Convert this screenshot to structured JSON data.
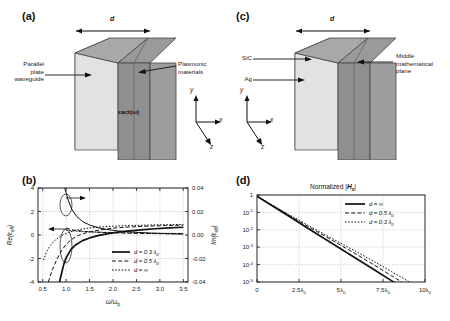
{
  "figure": {
    "panels": [
      "a",
      "b",
      "c",
      "d"
    ]
  },
  "panel_a": {
    "label": "(a)",
    "dim_label": "d",
    "left_annotation": "Parallel\nplate\nwaveguide",
    "right_annotation": "Plasmonic\nmaterials",
    "face_label": "εact(ω)",
    "axes": {
      "x": "x",
      "y": "y",
      "z": "z"
    }
  },
  "panel_c": {
    "label": "(c)",
    "dim_label": "d",
    "annotation_sic": "SiC",
    "annotation_ag": "Ag",
    "right_annotation": "Middle\nmathematical\nplane",
    "axes": {
      "x": "x",
      "y": "y",
      "z": "z"
    }
  },
  "panel_b": {
    "label": "(b)",
    "arrow_left_note": "Re(εeff) points to left axis",
    "arrow_right_note": "Im(εeff) points to right axis"
  },
  "panel_d": {
    "label": "(d)"
  },
  "chart_data": [
    {
      "id": "panel-b",
      "type": "line",
      "title": "",
      "xlabel": "ω/ωp",
      "ylabel": "Re(εeff)",
      "y2label": "Im(εeff)",
      "xlim": [
        0.4,
        3.6
      ],
      "ylim": [
        -4,
        4
      ],
      "y2lim": [
        -0.04,
        0.04
      ],
      "xticks": [
        0.5,
        1.0,
        1.5,
        2.0,
        2.5,
        3.0,
        3.5
      ],
      "xticklabels": [
        "0.5",
        "1.0",
        "1.5",
        "2.0",
        "2.5",
        "3.0",
        "3.5"
      ],
      "yticks": [
        -4,
        -2,
        0,
        2,
        4
      ],
      "yticklabels": [
        "-4",
        "-2",
        "0",
        "2",
        "4"
      ],
      "y2ticks": [
        -0.04,
        -0.02,
        0.0,
        0.02,
        0.04
      ],
      "y2ticklabels": [
        "-0.04",
        "-0.02",
        "0.00",
        "0.02",
        "0.04"
      ],
      "grid": true,
      "legend_position": "lower-right",
      "legend": [
        {
          "label": "d = 0.3 λ0",
          "style": "solid"
        },
        {
          "label": "d = 0.5 λ0",
          "style": "dashed"
        },
        {
          "label": "d = ∞",
          "style": "dotted"
        }
      ],
      "series": [
        {
          "name": "Re(eps_eff) d = 0.3 lambda0",
          "axis": "left",
          "style": "solid",
          "width": 1.7,
          "x": [
            0.86,
            0.9,
            0.95,
            1.0,
            1.1,
            1.2,
            1.35,
            1.5,
            1.7,
            1.9,
            2.1,
            2.3,
            2.6,
            2.9,
            3.2,
            3.5
          ],
          "y": [
            -4.0,
            -3.3,
            -2.5,
            -1.95,
            -1.25,
            -0.85,
            -0.48,
            -0.25,
            -0.03,
            0.12,
            0.24,
            0.33,
            0.44,
            0.53,
            0.6,
            0.66
          ]
        },
        {
          "name": "Re(eps_eff) d = 0.5 lambda0",
          "axis": "left",
          "style": "dashed",
          "width": 1.0,
          "x": [
            0.62,
            0.7,
            0.8,
            0.9,
            1.0,
            1.1,
            1.25,
            1.45,
            1.7,
            2.0,
            2.3,
            2.7,
            3.1,
            3.5
          ],
          "y": [
            -4.0,
            -3.0,
            -2.1,
            -1.35,
            -0.8,
            -0.42,
            -0.05,
            0.22,
            0.42,
            0.58,
            0.67,
            0.75,
            0.8,
            0.84
          ]
        },
        {
          "name": "Re(eps_eff) d = infinity",
          "axis": "left",
          "style": "dotted",
          "width": 1.0,
          "x": [
            0.52,
            0.58,
            0.65,
            0.75,
            0.85,
            0.95,
            1.05,
            1.2,
            1.4,
            1.7,
            2.0,
            2.4,
            2.9,
            3.5
          ],
          "y": [
            -2.15,
            -1.45,
            -0.95,
            -0.5,
            -0.18,
            0.05,
            0.22,
            0.4,
            0.55,
            0.68,
            0.75,
            0.81,
            0.86,
            0.9
          ]
        },
        {
          "name": "Im(eps_eff) d = 0.3 lambda0",
          "axis": "right",
          "style": "solid",
          "width": 1.0,
          "x": [
            0.97,
            1.0,
            1.05,
            1.12,
            1.22,
            1.35,
            1.5,
            1.7,
            1.9,
            2.1,
            2.4,
            2.8,
            3.2,
            3.5
          ],
          "y": [
            0.04,
            0.036,
            0.029,
            0.022,
            0.016,
            0.0115,
            0.0085,
            0.006,
            0.0045,
            0.0035,
            0.0025,
            0.0016,
            0.0011,
            0.0008
          ]
        },
        {
          "name": "Im(eps_eff) d = 0.5 lambda0",
          "axis": "right",
          "style": "dashed",
          "width": 1.0,
          "x": [
            1.0,
            1.1,
            1.25,
            1.45,
            1.7,
            2.0,
            2.4,
            2.9,
            3.5
          ],
          "y": [
            0.006,
            0.0046,
            0.0036,
            0.0029,
            0.0023,
            0.0019,
            0.0015,
            0.0012,
            0.001
          ]
        },
        {
          "name": "Im(eps_eff) d = infinity",
          "axis": "right",
          "style": "dotted",
          "width": 1.0,
          "x": [
            1.0,
            1.15,
            1.35,
            1.6,
            1.95,
            2.4,
            2.9,
            3.5
          ],
          "y": [
            0.0042,
            0.0035,
            0.0029,
            0.0025,
            0.0021,
            0.0018,
            0.0015,
            0.0013
          ]
        }
      ]
    },
    {
      "id": "panel-d",
      "type": "line",
      "title": "Normalized |Hx|",
      "xlabel": "",
      "ylabel": "",
      "xlim": [
        0,
        10
      ],
      "ylim": [
        1e-05,
        1
      ],
      "yscale": "log",
      "xticks": [
        0,
        2.5,
        5,
        7.5,
        10
      ],
      "xticklabels": [
        "0",
        "2.5λ0",
        "5λ0",
        "7.5λ0",
        "10λ0"
      ],
      "yticks": [
        1,
        0.1,
        0.01,
        0.001,
        0.0001,
        1e-05
      ],
      "yticklabels": [
        "1",
        "10-1",
        "10-2",
        "10-3",
        "10-4",
        "10-5"
      ],
      "grid": true,
      "legend_position": "upper-right",
      "legend": [
        {
          "label": "d = ∞",
          "style": "solid"
        },
        {
          "label": "d = 0.5 λ0",
          "style": "dashed"
        },
        {
          "label": "d = 0.3 λ0",
          "style": "dotted"
        }
      ],
      "series": [
        {
          "name": "d = infinity",
          "style": "solid",
          "width": 1.7,
          "x": [
            0,
            1,
            2,
            3,
            4,
            5,
            6,
            7,
            8,
            8.85
          ],
          "y": [
            0.85,
            0.21,
            0.052,
            0.0128,
            0.0032,
            0.00079,
            0.000196,
            4.85e-05,
            1.2e-05,
            4e-06
          ]
        },
        {
          "name": "d = 0.5 lambda0",
          "style": "dashed",
          "width": 1.0,
          "x": [
            0,
            1,
            2,
            3,
            4,
            5,
            6,
            7,
            8,
            9,
            9.4
          ],
          "y": [
            0.85,
            0.225,
            0.06,
            0.0163,
            0.0046,
            0.00128,
            0.00035,
            9.2e-05,
            2.3e-05,
            6e-06,
            3.3e-06
          ]
        },
        {
          "name": "d = 0.3 lambda0",
          "style": "dotted",
          "width": 1.0,
          "x": [
            0,
            1,
            2,
            3,
            4,
            5,
            6,
            7,
            8,
            9,
            9.8
          ],
          "y": [
            0.85,
            0.235,
            0.066,
            0.019,
            0.0056,
            0.00166,
            0.0005,
            0.000145,
            4e-05,
            1.1e-05,
            3.4e-06
          ]
        }
      ]
    }
  ]
}
